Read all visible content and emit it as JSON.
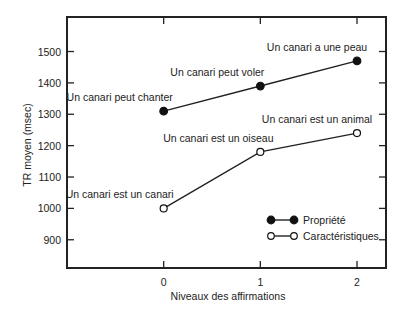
{
  "chart_data": {
    "type": "line",
    "title": "",
    "xlabel": "Niveaux des affirmations",
    "ylabel": "TR moyen (msec)",
    "x": [
      0,
      1,
      2
    ],
    "x_tick_labels": [
      "0",
      "1",
      "2"
    ],
    "xlim": [
      -1.0,
      2.3
    ],
    "ylim": [
      810,
      1610
    ],
    "y_ticks": [
      900,
      1000,
      1100,
      1200,
      1300,
      1400,
      1500
    ],
    "y_tick_labels": [
      "900",
      "1000",
      "1100",
      "1200",
      "1300",
      "1400",
      "1500"
    ],
    "grid": false,
    "legend_position": "bottom-right",
    "series": [
      {
        "name": "Propriété",
        "marker": "filled-circle",
        "values": [
          1310,
          1390,
          1470
        ],
        "point_labels": [
          "Un canari peut chanter",
          "Un canari peut voler",
          "Un canari a une peau"
        ]
      },
      {
        "name": "Caractéristiques",
        "marker": "open-circle",
        "values": [
          1000,
          1180,
          1240
        ],
        "point_labels": [
          "Un canari est un canari",
          "Un canari est un oiseau",
          "Un canari est un animal"
        ]
      }
    ]
  }
}
